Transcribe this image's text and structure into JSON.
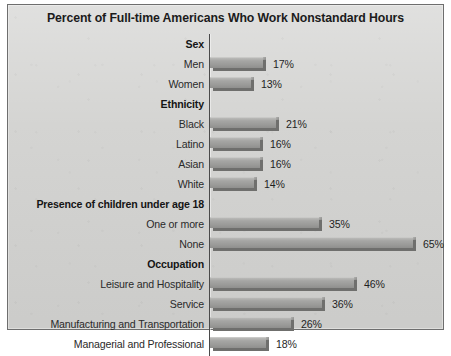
{
  "chart_data": {
    "type": "bar",
    "orientation": "horizontal",
    "title": "Percent of Full-time Americans Who Work Nonstandard Hours",
    "xlabel": "",
    "ylabel": "",
    "xlim": [
      0,
      70
    ],
    "grid": false,
    "legend": null,
    "value_suffix": "%",
    "groups": [
      {
        "heading": "Sex",
        "categories": [
          "Men",
          "Women"
        ],
        "values": [
          17,
          13
        ],
        "labels": [
          "17%",
          "13%"
        ]
      },
      {
        "heading": "Ethnicity",
        "categories": [
          "Black",
          "Latino",
          "Asian",
          "White"
        ],
        "values": [
          21,
          16,
          16,
          14
        ],
        "labels": [
          "21%",
          "16%",
          "16%",
          "14%"
        ]
      },
      {
        "heading": "Presence of children under age 18",
        "categories": [
          "One or more",
          "None"
        ],
        "values": [
          35,
          65
        ],
        "labels": [
          "35%",
          "65%"
        ]
      },
      {
        "heading": "Occupation",
        "categories": [
          "Leisure and Hospitality",
          "Service",
          "Manufacturing and Transportation",
          "Managerial and Professional"
        ],
        "values": [
          46,
          36,
          26,
          18
        ],
        "labels": [
          "46%",
          "36%",
          "26%",
          "18%"
        ]
      }
    ],
    "categories": [
      "Men",
      "Women",
      "Black",
      "Latino",
      "Asian",
      "White",
      "One or more",
      "None",
      "Leisure and Hospitality",
      "Service",
      "Manufacturing and Transportation",
      "Managerial and Professional"
    ],
    "values": [
      17,
      13,
      21,
      16,
      16,
      14,
      35,
      65,
      46,
      36,
      26,
      18
    ]
  },
  "style": {
    "panel_background": "#d3d3d1",
    "panel_border": "#6e6e6e",
    "bar_fill": "#9a9a98",
    "bar_shadow": "#6f6f6d",
    "axis_color": "#4a4a4a",
    "title_color": "#1b1b1b",
    "label_color": "#2a2a2a"
  }
}
